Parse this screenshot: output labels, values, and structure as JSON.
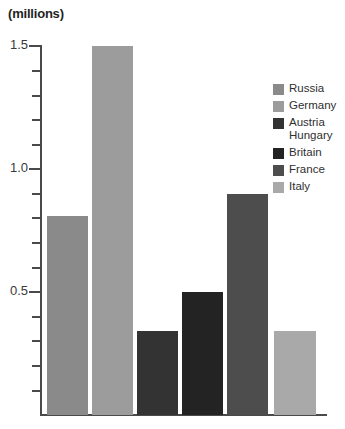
{
  "chart_data": {
    "type": "bar",
    "title": "(millions)",
    "xlabel": "",
    "ylabel": "(millions)",
    "unit": "millions",
    "categories": [
      "Russia",
      "Germany",
      "Austria Hungary",
      "Britain",
      "France",
      "Italy"
    ],
    "values": [
      0.81,
      1.5,
      0.34,
      0.5,
      0.9,
      0.34
    ],
    "ylim": [
      0,
      1.55
    ],
    "ytick_labels": [
      "1.5",
      "1.0",
      "0.5"
    ],
    "ytick_values": [
      1.5,
      1.0,
      0.5
    ],
    "yminor_step": 0.1,
    "grid": false,
    "legend_position": "right",
    "series": [
      {
        "name": "Russia",
        "value": 0.81,
        "color": "#8a8a8a"
      },
      {
        "name": "Germany",
        "value": 1.5,
        "color": "#9c9c9c"
      },
      {
        "name": "Austria Hungary",
        "value": 0.34,
        "color": "#333333"
      },
      {
        "name": "Britain",
        "value": 0.5,
        "color": "#232323"
      },
      {
        "name": "France",
        "value": 0.9,
        "color": "#4d4d4d"
      },
      {
        "name": "Italy",
        "value": 0.34,
        "color": "#a9a9a9"
      }
    ]
  },
  "legend": {
    "items": [
      {
        "label": "Russia",
        "color": "#8a8a8a"
      },
      {
        "label": "Germany",
        "color": "#9c9c9c"
      },
      {
        "label": "Austria\nHungary",
        "color": "#333333"
      },
      {
        "label": "Britain",
        "color": "#232323"
      },
      {
        "label": "France",
        "color": "#4d4d4d"
      },
      {
        "label": "Italy",
        "color": "#a9a9a9"
      }
    ]
  },
  "axis": {
    "tick_labels": [
      "1.5",
      "1.0",
      "0.5"
    ],
    "line_color": "#4a4a4a"
  },
  "colors": {
    "background": "#ffffff",
    "text": "#2b2b2b",
    "axis": "#4a4a4a"
  }
}
